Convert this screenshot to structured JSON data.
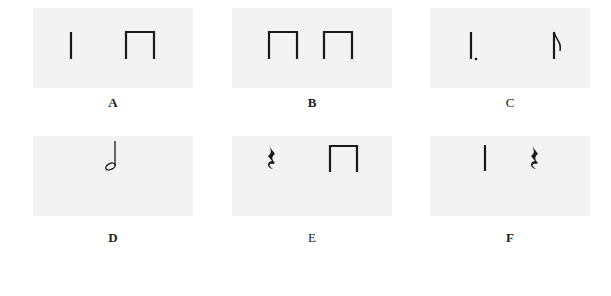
{
  "figure": {
    "panels": [
      {
        "label": "A",
        "symbols": [
          "quarter-note-stem",
          "beamed-eighth-pair"
        ]
      },
      {
        "label": "B",
        "symbols": [
          "beamed-eighth-pair",
          "beamed-eighth-pair"
        ]
      },
      {
        "label": "C",
        "symbols": [
          "dotted-quarter-stem",
          "eighth-note-stem"
        ]
      },
      {
        "label": "D",
        "symbols": [
          "half-note"
        ]
      },
      {
        "label": "E",
        "symbols": [
          "quarter-rest",
          "beamed-eighth-pair"
        ]
      },
      {
        "label": "F",
        "symbols": [
          "quarter-note-stem",
          "quarter-rest"
        ]
      }
    ]
  }
}
